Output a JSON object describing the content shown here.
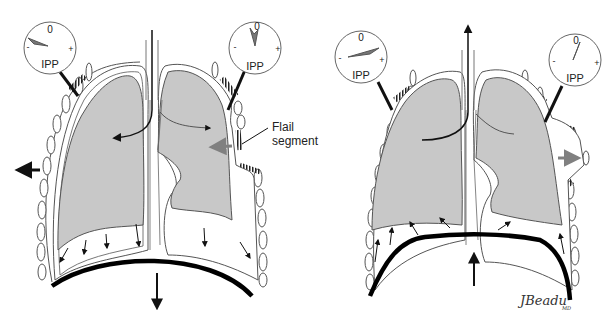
{
  "diagram": {
    "panels": [
      {
        "id": "inspiration",
        "gauges": [
          {
            "side": "left",
            "zero": "0",
            "minus": "-",
            "plus": "+",
            "label": "IPP",
            "needle": "negative"
          },
          {
            "side": "right",
            "zero": "0",
            "minus": "-",
            "plus": "+",
            "label": "IPP",
            "needle": "near-zero"
          }
        ],
        "callout": {
          "line1": "Flail",
          "line2": "segment"
        }
      },
      {
        "id": "expiration",
        "gauges": [
          {
            "side": "left",
            "zero": "0",
            "minus": "-",
            "plus": "+",
            "label": "IPP",
            "needle": "positive"
          },
          {
            "side": "right",
            "zero": "0",
            "minus": "-",
            "plus": "+",
            "label": "IPP",
            "needle": "near-zero"
          }
        ]
      }
    ],
    "signature": {
      "text": "JBeadu",
      "suffix": "MD"
    },
    "colors": {
      "lung_fill": "#c8c8c8",
      "outline": "#555555",
      "arrow_black": "#111111",
      "arrow_gray": "#808080",
      "diaphragm": "#000000"
    }
  }
}
